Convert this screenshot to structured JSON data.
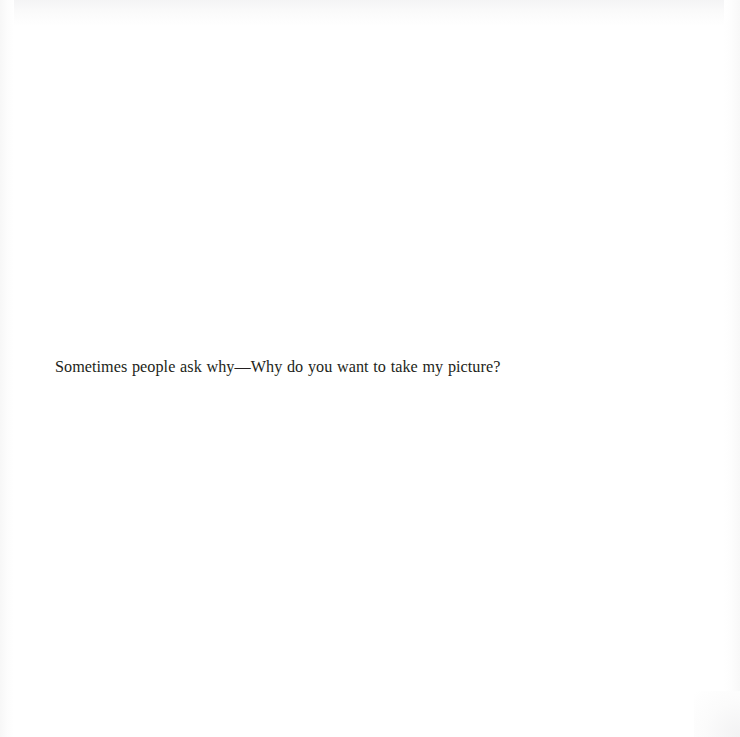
{
  "page": {
    "width": 740,
    "height": 737,
    "background_color": "#ffffff",
    "text_color": "#231f20",
    "medium": "scanned-book-page"
  },
  "body": {
    "lines": [
      "Sometimes people ask why—Why do you want to take my picture?"
    ]
  }
}
